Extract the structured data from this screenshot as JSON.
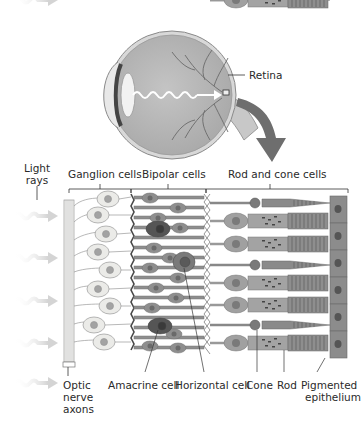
{
  "eye": {
    "retina_label": "Retina"
  },
  "retina_layers": {
    "light_rays_label_line1": "Light",
    "light_rays_label_line2": "rays",
    "ganglion_label": "Ganglion cells",
    "bipolar_label": "Bipolar cells",
    "rod_cone_label": "Rod and cone cells"
  },
  "bottom_labels": {
    "optic_line1": "Optic",
    "optic_line2": "nerve",
    "optic_line3": "axons",
    "amacrine": "Amacrine cell",
    "horizontal": "Horizontal cell",
    "cone": "Cone",
    "rod": "Rod",
    "pigmented_line1": "Pigmented",
    "pigmented_line2": "epithelium"
  },
  "colors": {
    "eye_body": "#b9b9b9",
    "eye_outline": "#8a8a8a",
    "arrow": "#6e6e6e",
    "ganglion_cell": "#e9e9e6",
    "ganglion_nucleus": "#a3a3a3",
    "bipolar_cell": "#8e8e8e",
    "bipolar_dark": "#555555",
    "photoreceptor": "#9d9d9d",
    "epithelium": "#8c8c8c",
    "text": "#2a2a2a"
  }
}
